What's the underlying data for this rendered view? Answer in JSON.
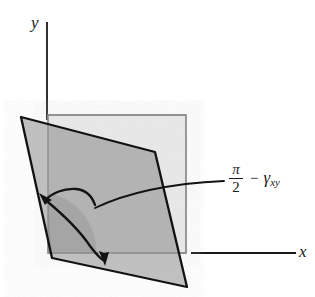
{
  "figure": {
    "axes": {
      "y_label": "y",
      "x_label": "x",
      "y_axis_line": {
        "x1": 47,
        "y1": 22,
        "x2": 47,
        "y2": 120
      },
      "x_axis_line": {
        "x1": 191,
        "y1": 253,
        "x2": 295,
        "y2": 253
      }
    },
    "annotation": {
      "pi_symbol": "π",
      "denominator": "2",
      "minus": "−",
      "gamma_symbol": "γ",
      "gamma_subscript": "xy",
      "full_text": "π/2 − γxy"
    },
    "shapes": {
      "undeformed_square": {
        "name": "undeformed-square",
        "points": "48,115 186,115 186,253 48,253",
        "fill": "#e9e9e9",
        "stroke": "#8a8a8a",
        "stroke_width": 1.2
      },
      "deformed_parallelogram": {
        "name": "deformed-parallelogram",
        "points": "21,117 155,152 187,287 52,258",
        "fill": "#bcbcbc",
        "stroke": "#111111",
        "stroke_width": 2.2
      },
      "overlap_region": {
        "name": "overlap-region",
        "points": "48,124 48,253 96,253 63,245 52,258 48,253",
        "fill": "#9d9d9d"
      }
    },
    "angle_arc": {
      "name": "angle-arc",
      "vertex": {
        "x": 52,
        "y": 258
      },
      "start_arrow": {
        "x": 42,
        "y": 196
      },
      "end_arrow": {
        "x": 105,
        "y": 262
      },
      "stroke": "#111111",
      "stroke_width": 2.2
    },
    "leader_line": {
      "name": "leader-line",
      "from": {
        "x": 95,
        "y": 209
      },
      "to": {
        "x": 224,
        "y": 182
      },
      "stroke": "#111111",
      "stroke_width": 1.8
    },
    "colors": {
      "ink": "#111111",
      "axis": "#1a1a1a",
      "light_gray": "#e9e9e9",
      "mid_gray": "#bcbcbc",
      "dark_gray": "#9d9d9d",
      "square_outline": "#8a8a8a",
      "background": "#ffffff"
    }
  }
}
